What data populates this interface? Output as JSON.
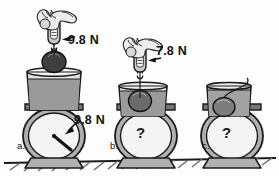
{
  "figure": {
    "type": "physics-illustration",
    "panel_count": 3
  },
  "colors": {
    "ink": "#1a1a1a",
    "water": "#9a9a9a",
    "water_light": "#b5b5b5",
    "metal_gray": "#a8a8a8",
    "metal_dark": "#6f6f6f",
    "ball_dark": "#4a4a4a",
    "scale_face": "#f2f2f2",
    "hand_fill": "#ececec",
    "background": "#fdfdfd",
    "ground": "#8d8d8d"
  },
  "panels": [
    {
      "id": "a",
      "label": "a.",
      "spring_scale_reading": "9.8 N",
      "bathroom_scale_reading": "9.8 N",
      "bathroom_scale_unknown": false,
      "object_state": "hanging in air above the water",
      "needle_visible": true
    },
    {
      "id": "b",
      "label": "b.",
      "spring_scale_reading": "7.8 N",
      "bathroom_scale_reading": "?",
      "bathroom_scale_unknown": true,
      "object_state": "fully submerged, suspended by string",
      "needle_visible": false
    },
    {
      "id": "c",
      "label": "c.",
      "spring_scale_reading": "",
      "bathroom_scale_reading": "?",
      "bathroom_scale_unknown": true,
      "object_state": "resting on bottom of beaker, string slack",
      "needle_visible": false
    }
  ],
  "labels": {
    "a_spring_force": "9.8 N",
    "a_scale_force": "9.8 N",
    "b_spring_force": "7.8 N",
    "a_panel": "a.",
    "b_panel": "b.",
    "c_panel": "c.",
    "b_scale_unknown": "?",
    "c_scale_unknown": "?"
  },
  "icons": {
    "hand": "hand-icon",
    "spring_scale": "spring-scale-icon",
    "hook": "hook-icon",
    "ball": "ball-icon",
    "beaker": "beaker-icon",
    "bathroom_scale": "bathroom-scale-icon",
    "arrow": "arrow-icon",
    "ground": "ground-hatching-icon"
  }
}
